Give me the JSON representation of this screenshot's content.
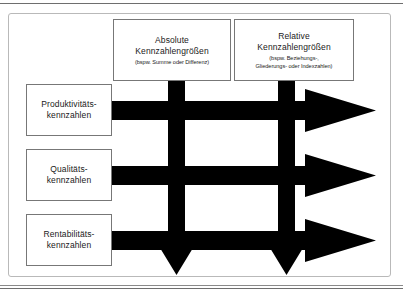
{
  "figure": {
    "type": "matrix-diagram",
    "caption": "",
    "frame_color": "#b9b9b9",
    "arrow_color": "#000000",
    "box_border_color": "#777777",
    "background": "#ffffff"
  },
  "columns": [
    {
      "id": "absolute",
      "title_line1": "Absolute",
      "title_line2": "Kennzahlengrößen",
      "subtitle_line1": "(bspw. Summe oder Differenz)",
      "subtitle_line2": ""
    },
    {
      "id": "relative",
      "title_line1": "Relative",
      "title_line2": "Kennzahlengrößen",
      "subtitle_line1": "(bspw. Beziehungs-,",
      "subtitle_line2": "Gliederungs- oder Indexzahlen)"
    }
  ],
  "rows": [
    {
      "id": "produktivitaet",
      "title_line1": "Produktivitäts-",
      "title_line2": "kennzahlen"
    },
    {
      "id": "qualitaet",
      "title_line1": "Qualitäts-",
      "title_line2": "kennzahlen"
    },
    {
      "id": "rentabilitaet",
      "title_line1": "Rentabilitäts-",
      "title_line2": "kennzahlen"
    }
  ],
  "arrows": {
    "horizontal_count": 3,
    "vertical_count": 2,
    "horizontal_direction": "right",
    "vertical_direction": "down"
  }
}
